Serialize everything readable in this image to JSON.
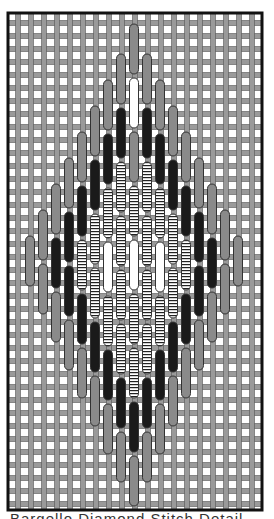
{
  "diagram": {
    "frame": {
      "x": 8,
      "y": 13,
      "width": 254,
      "height": 497
    },
    "grid": {
      "spacing": 13,
      "thread_color": "#9a9a9a",
      "thread_edge": "#555555",
      "thread_width": 5
    },
    "colors": {
      "medium": "#8a8a8a",
      "dark": "#1a1a1a",
      "light": "#ffffff",
      "striped": "#ffffff",
      "outline": "#333333"
    },
    "stitch_length": 52,
    "columns": [
      {
        "x": 30,
        "stitches": [
          {
            "y": 236,
            "c": "medium"
          }
        ]
      },
      {
        "x": 43,
        "stitches": [
          {
            "y": 210,
            "c": "medium"
          },
          {
            "y": 264,
            "c": "medium"
          }
        ]
      },
      {
        "x": 56,
        "stitches": [
          {
            "y": 184,
            "c": "medium"
          },
          {
            "y": 238,
            "c": "dark"
          },
          {
            "y": 292,
            "c": "medium"
          }
        ]
      },
      {
        "x": 69,
        "stitches": [
          {
            "y": 158,
            "c": "medium"
          },
          {
            "y": 212,
            "c": "dark"
          },
          {
            "y": 266,
            "c": "dark"
          },
          {
            "y": 320,
            "c": "medium"
          }
        ]
      },
      {
        "x": 82,
        "stitches": [
          {
            "y": 132,
            "c": "medium"
          },
          {
            "y": 186,
            "c": "dark"
          },
          {
            "y": 240,
            "c": "striped"
          },
          {
            "y": 294,
            "c": "dark"
          },
          {
            "y": 348,
            "c": "medium"
          }
        ]
      },
      {
        "x": 95,
        "stitches": [
          {
            "y": 106,
            "c": "medium"
          },
          {
            "y": 160,
            "c": "dark"
          },
          {
            "y": 214,
            "c": "striped"
          },
          {
            "y": 268,
            "c": "striped"
          },
          {
            "y": 322,
            "c": "dark"
          },
          {
            "y": 376,
            "c": "medium"
          }
        ]
      },
      {
        "x": 108,
        "stitches": [
          {
            "y": 80,
            "c": "medium"
          },
          {
            "y": 134,
            "c": "dark"
          },
          {
            "y": 188,
            "c": "striped"
          },
          {
            "y": 242,
            "c": "light"
          },
          {
            "y": 296,
            "c": "striped"
          },
          {
            "y": 350,
            "c": "dark"
          },
          {
            "y": 404,
            "c": "medium"
          }
        ]
      },
      {
        "x": 121,
        "stitches": [
          {
            "y": 54,
            "c": "medium"
          },
          {
            "y": 108,
            "c": "dark"
          },
          {
            "y": 162,
            "c": "striped"
          },
          {
            "y": 216,
            "c": "striped"
          },
          {
            "y": 270,
            "c": "striped"
          },
          {
            "y": 324,
            "c": "striped"
          },
          {
            "y": 378,
            "c": "dark"
          },
          {
            "y": 432,
            "c": "medium"
          }
        ]
      },
      {
        "x": 134,
        "stitches": [
          {
            "y": 24,
            "c": "medium"
          },
          {
            "y": 78,
            "c": "light"
          },
          {
            "y": 132,
            "c": "medium"
          },
          {
            "y": 186,
            "c": "striped"
          },
          {
            "y": 240,
            "c": "light"
          },
          {
            "y": 294,
            "c": "striped"
          },
          {
            "y": 348,
            "c": "striped"
          },
          {
            "y": 402,
            "c": "dark"
          },
          {
            "y": 456,
            "c": "medium"
          }
        ]
      },
      {
        "x": 147,
        "stitches": [
          {
            "y": 54,
            "c": "medium"
          },
          {
            "y": 108,
            "c": "dark"
          },
          {
            "y": 162,
            "c": "striped"
          },
          {
            "y": 216,
            "c": "striped"
          },
          {
            "y": 270,
            "c": "striped"
          },
          {
            "y": 324,
            "c": "striped"
          },
          {
            "y": 378,
            "c": "dark"
          },
          {
            "y": 432,
            "c": "medium"
          }
        ]
      },
      {
        "x": 160,
        "stitches": [
          {
            "y": 80,
            "c": "medium"
          },
          {
            "y": 134,
            "c": "dark"
          },
          {
            "y": 188,
            "c": "striped"
          },
          {
            "y": 242,
            "c": "light"
          },
          {
            "y": 296,
            "c": "striped"
          },
          {
            "y": 350,
            "c": "dark"
          },
          {
            "y": 404,
            "c": "medium"
          }
        ]
      },
      {
        "x": 173,
        "stitches": [
          {
            "y": 106,
            "c": "medium"
          },
          {
            "y": 160,
            "c": "dark"
          },
          {
            "y": 214,
            "c": "striped"
          },
          {
            "y": 268,
            "c": "striped"
          },
          {
            "y": 322,
            "c": "dark"
          },
          {
            "y": 376,
            "c": "medium"
          }
        ]
      },
      {
        "x": 186,
        "stitches": [
          {
            "y": 132,
            "c": "medium"
          },
          {
            "y": 186,
            "c": "dark"
          },
          {
            "y": 240,
            "c": "striped"
          },
          {
            "y": 294,
            "c": "dark"
          },
          {
            "y": 348,
            "c": "medium"
          }
        ]
      },
      {
        "x": 199,
        "stitches": [
          {
            "y": 158,
            "c": "medium"
          },
          {
            "y": 212,
            "c": "dark"
          },
          {
            "y": 266,
            "c": "dark"
          },
          {
            "y": 320,
            "c": "medium"
          }
        ]
      },
      {
        "x": 212,
        "stitches": [
          {
            "y": 184,
            "c": "medium"
          },
          {
            "y": 238,
            "c": "dark"
          },
          {
            "y": 292,
            "c": "medium"
          }
        ]
      },
      {
        "x": 225,
        "stitches": [
          {
            "y": 210,
            "c": "medium"
          },
          {
            "y": 264,
            "c": "medium"
          }
        ]
      },
      {
        "x": 238,
        "stitches": [
          {
            "y": 236,
            "c": "medium"
          }
        ]
      }
    ],
    "caption": "Bargello Diamond Stitch Detail"
  }
}
